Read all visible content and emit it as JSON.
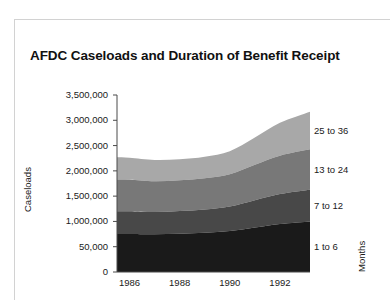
{
  "figure": {
    "title": "AFDC Caseloads and Duration of Benefit Receipt"
  },
  "axes": {
    "ylabel": "Caseloads",
    "right_axis_label": "Months",
    "ytick_labels": [
      "3,500,000",
      "3,000,000",
      "2,500,000",
      "2,000,000",
      "1,500,000",
      "1,000,000",
      "50,000",
      "0"
    ],
    "xtick_labels": [
      "1986",
      "1988",
      "1990",
      "1992"
    ]
  },
  "series_labels": {
    "s4": "25 to 36",
    "s3": "13 to 24",
    "s2": "7 to 12",
    "s1": "1 to 6"
  },
  "colors": {
    "band_1_to_6": "#1a1a1a",
    "band_7_to_12": "#484848",
    "band_13_to_24": "#787878",
    "band_25_to_36": "#a8a8a8",
    "axis": "#4a4a4a",
    "frame": "#d2d2d2",
    "background": "#ffffff"
  },
  "chart_data": {
    "type": "area",
    "title": "AFDC Caseloads and Duration of Benefit Receipt",
    "xlabel": "",
    "ylabel": "Caseloads",
    "right_axis_label": "Months",
    "stacked": true,
    "grid": false,
    "legend_position": "right-inline",
    "xlim": [
      1985.5,
      1993.2
    ],
    "ylim": [
      0,
      3500000
    ],
    "yticks": [
      0,
      500000,
      1000000,
      1500000,
      2000000,
      2500000,
      3000000,
      3500000
    ],
    "ytick_labels": [
      "0",
      "50,000",
      "1,000,000",
      "1,500,000",
      "2,000,000",
      "2,500,000",
      "3,000,000",
      "3,500,000"
    ],
    "xticks": [
      1986,
      1988,
      1990,
      1992
    ],
    "x": [
      1985.5,
      1986,
      1987,
      1988,
      1989,
      1990,
      1991,
      1992,
      1993.2
    ],
    "series": [
      {
        "name": "1 to 6",
        "color": "#1a1a1a",
        "values": [
          750000,
          750000,
          745000,
          755000,
          775000,
          810000,
          880000,
          950000,
          1000000
        ]
      },
      {
        "name": "7 to 12",
        "color": "#484848",
        "values": [
          450000,
          450000,
          440000,
          450000,
          460000,
          485000,
          540000,
          590000,
          625000
        ]
      },
      {
        "name": "13 to 24",
        "color": "#787878",
        "values": [
          630000,
          625000,
          610000,
          610000,
          620000,
          640000,
          700000,
          760000,
          800000
        ]
      },
      {
        "name": "25 to 36",
        "color": "#a8a8a8",
        "values": [
          440000,
          435000,
          420000,
          415000,
          425000,
          455000,
          540000,
          650000,
          745000
        ]
      }
    ],
    "totals": [
      2270000,
      2260000,
      2215000,
      2230000,
      2280000,
      2390000,
      2660000,
      2950000,
      3170000
    ]
  }
}
